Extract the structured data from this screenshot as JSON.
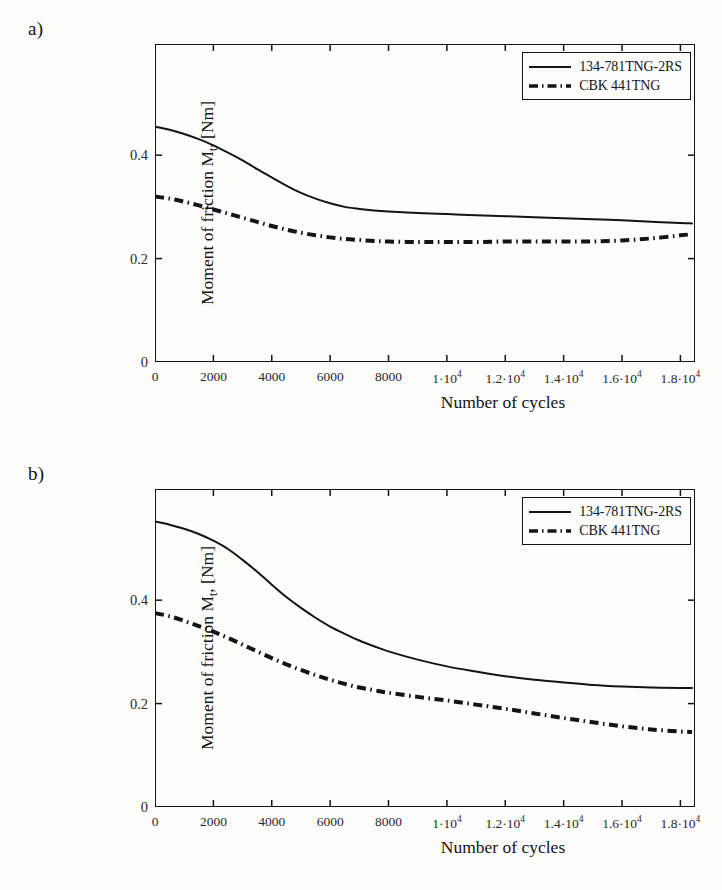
{
  "figure": {
    "background_color": "#fdfdfc",
    "ink_color": "#141414"
  },
  "panels": [
    {
      "label": "a)",
      "chart_data": {
        "type": "line",
        "title": "",
        "xlabel": "Number of cycles",
        "ylabel": "Moment of friction Mt, [Nm]",
        "ylabel_main": "Moment of friction M",
        "ylabel_sub": "t",
        "ylabel_tail": ", [Nm]",
        "xlim": [
          0,
          18500
        ],
        "ylim": [
          0,
          0.615
        ],
        "grid": false,
        "legend_position": "top-right",
        "xticks": [
          0,
          2000,
          4000,
          6000,
          8000,
          10000,
          12000,
          14000,
          16000,
          18000
        ],
        "xticklabels": [
          "0",
          "2000",
          "4000",
          "6000",
          "8000",
          "1·10^4",
          "1.2·10^4",
          "1.4·10^4",
          "1.6·10^4",
          "1.8·10^4"
        ],
        "yticks": [
          0,
          0.2,
          0.4
        ],
        "yticklabels": [
          "0",
          "0.2",
          "0.4"
        ],
        "x": [
          0,
          500,
          1000,
          1500,
          2000,
          2500,
          3000,
          3500,
          4000,
          4500,
          5000,
          5500,
          6000,
          6500,
          7000,
          7500,
          8000,
          9000,
          10000,
          11000,
          12000,
          13000,
          14000,
          15000,
          16000,
          17000,
          18000,
          18400
        ],
        "series": [
          {
            "name": "134-781TNG-2RS",
            "style": "solid",
            "values": [
              0.455,
              0.449,
              0.441,
              0.431,
              0.419,
              0.405,
              0.39,
              0.373,
              0.357,
              0.341,
              0.327,
              0.316,
              0.307,
              0.3,
              0.296,
              0.293,
              0.291,
              0.288,
              0.286,
              0.284,
              0.282,
              0.28,
              0.278,
              0.276,
              0.274,
              0.271,
              0.269,
              0.268
            ]
          },
          {
            "name": "CBK 441TNG",
            "style": "dashdot",
            "values": [
              0.32,
              0.316,
              0.31,
              0.303,
              0.295,
              0.287,
              0.279,
              0.271,
              0.263,
              0.256,
              0.25,
              0.245,
              0.241,
              0.238,
              0.236,
              0.234,
              0.233,
              0.232,
              0.232,
              0.232,
              0.233,
              0.233,
              0.233,
              0.233,
              0.235,
              0.239,
              0.245,
              0.247
            ]
          }
        ]
      }
    },
    {
      "label": "b)",
      "chart_data": {
        "type": "line",
        "title": "",
        "xlabel": "Number of cycles",
        "ylabel": "Moment of friction Mt, [Nm]",
        "ylabel_main": "Moment of friction M",
        "ylabel_sub": "t",
        "ylabel_tail": ", [Nm]",
        "xlim": [
          0,
          18500
        ],
        "ylim": [
          0,
          0.615
        ],
        "grid": false,
        "legend_position": "top-right",
        "xticks": [
          0,
          2000,
          4000,
          6000,
          8000,
          10000,
          12000,
          14000,
          16000,
          18000
        ],
        "xticklabels": [
          "0",
          "2000",
          "4000",
          "6000",
          "8000",
          "1·10^4",
          "1.2·10^4",
          "1.4·10^4",
          "1.6·10^4",
          "1.8·10^4"
        ],
        "yticks": [
          0,
          0.2,
          0.4
        ],
        "yticklabels": [
          "0",
          "0.2",
          "0.4"
        ],
        "x": [
          0,
          500,
          1000,
          1500,
          2000,
          2500,
          3000,
          3500,
          4000,
          4500,
          5000,
          5500,
          6000,
          6500,
          7000,
          7500,
          8000,
          9000,
          10000,
          11000,
          12000,
          13000,
          14000,
          15000,
          16000,
          17000,
          18000,
          18400
        ],
        "series": [
          {
            "name": "134-781TNG-2RS",
            "style": "solid",
            "values": [
              0.552,
              0.546,
              0.538,
              0.528,
              0.515,
              0.499,
              0.478,
              0.455,
              0.43,
              0.406,
              0.385,
              0.366,
              0.349,
              0.335,
              0.322,
              0.311,
              0.301,
              0.285,
              0.272,
              0.262,
              0.253,
              0.246,
              0.241,
              0.236,
              0.233,
              0.231,
              0.23,
              0.23
            ]
          },
          {
            "name": "CBK 441TNG",
            "style": "dashdot",
            "values": [
              0.375,
              0.369,
              0.36,
              0.35,
              0.339,
              0.327,
              0.314,
              0.301,
              0.288,
              0.276,
              0.265,
              0.255,
              0.246,
              0.238,
              0.231,
              0.226,
              0.221,
              0.213,
              0.206,
              0.198,
              0.19,
              0.181,
              0.172,
              0.164,
              0.156,
              0.15,
              0.146,
              0.145
            ]
          }
        ]
      }
    }
  ]
}
